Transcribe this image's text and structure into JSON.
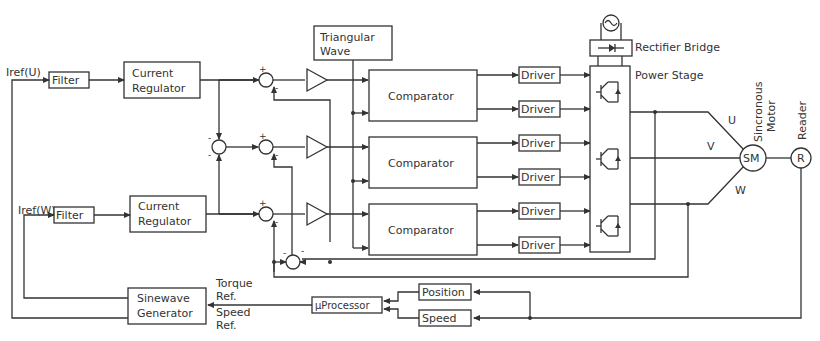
{
  "diagram": {
    "inputs": {
      "iref_u": "Iref(U)",
      "iref_w": "Iref(W)"
    },
    "blocks": {
      "filter_u": "Filter",
      "filter_w": "Filter",
      "current_regulator_u": [
        "Current",
        "Regulator"
      ],
      "current_regulator_w": [
        "Current",
        "Regulator"
      ],
      "triangular_wave": [
        "Triangular",
        "Wave"
      ],
      "comparator_1": "Comparator",
      "comparator_2": "Comparator",
      "comparator_3": "Comparator",
      "drivers": [
        "Driver",
        "Driver",
        "Driver",
        "Driver",
        "Driver",
        "Driver"
      ],
      "rectifier_bridge": "Rectifier Bridge",
      "power_stage": "Power Stage",
      "motor": "SM",
      "reader": "R",
      "sinewave_generator": [
        "Sinewave",
        "Generator"
      ],
      "microprocessor": "µProcessor",
      "position": "Position",
      "speed": "Speed"
    },
    "labels": {
      "phase_u": "U",
      "phase_v": "V",
      "phase_w": "W",
      "motor_label": [
        "Sincronous",
        "Motor"
      ],
      "reader_label": "Reader",
      "torque_ref": [
        "Torque",
        "Ref."
      ],
      "speed_ref": [
        "Speed",
        "Ref."
      ]
    },
    "signs": {
      "plus": "+",
      "minus": "-"
    }
  }
}
